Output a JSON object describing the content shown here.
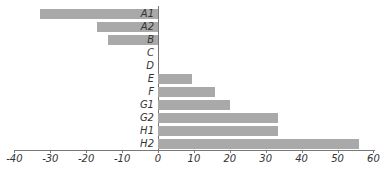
{
  "chart_data": {
    "type": "bar",
    "orientation": "horizontal",
    "title": "",
    "xlabel": "",
    "ylabel": "",
    "categories": [
      "A1",
      "A2",
      "B",
      "C",
      "D",
      "E",
      "F",
      "G1",
      "G2",
      "H1",
      "H2"
    ],
    "values": [
      -33,
      -17,
      -14,
      0,
      0,
      9.5,
      16,
      20,
      33.5,
      33.5,
      56
    ],
    "xlim": [
      -40,
      60
    ],
    "xticks": [
      -40,
      -30,
      -20,
      -10,
      0,
      10,
      20,
      30,
      40,
      50,
      60
    ],
    "grid": false,
    "legend": null,
    "bar_color": "#a9a9a9"
  },
  "axis": {
    "tick_labels": [
      "-40",
      "-30",
      "-20",
      "-10",
      "0",
      "10",
      "20",
      "30",
      "40",
      "50",
      "60"
    ]
  }
}
